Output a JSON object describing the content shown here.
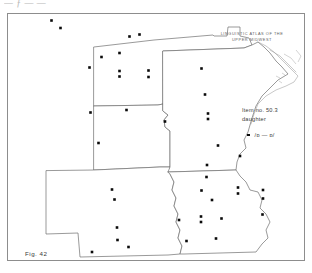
{
  "page": {
    "top_cropped_text": "— ƒ — —",
    "figure_label": "Fig. 42"
  },
  "atlas": {
    "title_line1": "LINGUISTIC  ATLAS  OF  THE",
    "title_line2": "UPPER  MIDWEST"
  },
  "legend": {
    "item_line": "Item no. 50.3",
    "keyword_line": "daughter",
    "symbol": "filled-square",
    "variant_label": "/ɒ — ɒ/"
  },
  "map": {
    "region": "Upper Midwest",
    "states": [
      "North Dakota",
      "South Dakota",
      "Nebraska",
      "Minnesota",
      "Iowa"
    ],
    "frame_color": "#8d8d8d",
    "outline_color": "#6f6f6f",
    "dot_color": "#0a0a0a"
  },
  "chart_data": {
    "type": "scatter",
    "title": "LINGUISTIC ATLAS OF THE UPPER MIDWEST",
    "subtitle": "Item no. 50.3 daughter",
    "xlabel": "",
    "ylabel": "",
    "legend_entries": [
      {
        "symbol": "filled-square",
        "label": "/ɒ — ɒ/"
      }
    ],
    "series": [
      {
        "name": "/ɒ — ɒ/ occurrences",
        "marker": "square",
        "color": "#0a0a0a",
        "points": [
          {
            "x": 51.5,
            "y": 20.5,
            "state": "North Dakota"
          },
          {
            "x": 60.5,
            "y": 28.0,
            "state": "North Dakota"
          },
          {
            "x": 129.5,
            "y": 36.5,
            "state": "North Dakota"
          },
          {
            "x": 139.5,
            "y": 34.5,
            "state": "North Dakota"
          },
          {
            "x": 101.5,
            "y": 57.0,
            "state": "North Dakota"
          },
          {
            "x": 119.5,
            "y": 53.0,
            "state": "North Dakota"
          },
          {
            "x": 89.5,
            "y": 67.5,
            "state": "North Dakota"
          },
          {
            "x": 119.5,
            "y": 71.0,
            "state": "North Dakota"
          },
          {
            "x": 119.5,
            "y": 76.5,
            "state": "North Dakota"
          },
          {
            "x": 148.5,
            "y": 70.5,
            "state": "North Dakota"
          },
          {
            "x": 148.5,
            "y": 77.0,
            "state": "North Dakota"
          },
          {
            "x": 90.5,
            "y": 112.5,
            "state": "South Dakota"
          },
          {
            "x": 126.5,
            "y": 110.0,
            "state": "South Dakota"
          },
          {
            "x": 98.5,
            "y": 143.0,
            "state": "South Dakota"
          },
          {
            "x": 112.0,
            "y": 189.5,
            "state": "Nebraska"
          },
          {
            "x": 114.5,
            "y": 199.5,
            "state": "Nebraska"
          },
          {
            "x": 117.0,
            "y": 227.5,
            "state": "Nebraska"
          },
          {
            "x": 117.5,
            "y": 240.0,
            "state": "Nebraska"
          },
          {
            "x": 92.0,
            "y": 252.0,
            "state": "Nebraska"
          },
          {
            "x": 128.5,
            "y": 247.0,
            "state": "Nebraska"
          },
          {
            "x": 201.5,
            "y": 68.5,
            "state": "Minnesota"
          },
          {
            "x": 205.0,
            "y": 94.5,
            "state": "Minnesota"
          },
          {
            "x": 208.0,
            "y": 113.5,
            "state": "Minnesota"
          },
          {
            "x": 208.0,
            "y": 119.0,
            "state": "Minnesota"
          },
          {
            "x": 165.0,
            "y": 121.5,
            "state": "Minnesota"
          },
          {
            "x": 218.0,
            "y": 145.5,
            "state": "Minnesota"
          },
          {
            "x": 240.0,
            "y": 156.0,
            "state": "Minnesota"
          },
          {
            "x": 207.0,
            "y": 165.0,
            "state": "Minnesota"
          },
          {
            "x": 206.5,
            "y": 177.0,
            "state": "Iowa"
          },
          {
            "x": 201.5,
            "y": 190.5,
            "state": "Iowa"
          },
          {
            "x": 212.0,
            "y": 200.0,
            "state": "Iowa"
          },
          {
            "x": 238.0,
            "y": 187.5,
            "state": "Iowa"
          },
          {
            "x": 238.0,
            "y": 193.5,
            "state": "Iowa"
          },
          {
            "x": 263.0,
            "y": 190.0,
            "state": "Iowa"
          },
          {
            "x": 263.0,
            "y": 198.5,
            "state": "Iowa"
          },
          {
            "x": 201.0,
            "y": 216.5,
            "state": "Iowa"
          },
          {
            "x": 201.0,
            "y": 222.0,
            "state": "Iowa"
          },
          {
            "x": 221.5,
            "y": 218.5,
            "state": "Iowa"
          },
          {
            "x": 179.0,
            "y": 220.0,
            "state": "Iowa"
          },
          {
            "x": 262.5,
            "y": 214.5,
            "state": "Iowa"
          },
          {
            "x": 216.0,
            "y": 238.5,
            "state": "Iowa"
          },
          {
            "x": 186.5,
            "y": 241.0,
            "state": "Iowa"
          }
        ]
      }
    ]
  }
}
